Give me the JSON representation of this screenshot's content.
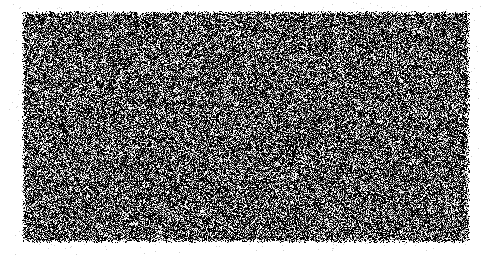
{
  "canvas": {
    "width": 492,
    "height": 256,
    "background_color": "#ffffff"
  },
  "image": {
    "type": "random-noise-field",
    "description": "Full-bleed rectangular field of high-frequency black-and-white random noise (salt-and-pepper static). No text, icons, axes, legends or interface chrome are present anywhere in the image.",
    "title": "Random noise field"
  },
  "noise_field": {
    "name": "noise-field",
    "left": 22,
    "top": 11,
    "width": 448,
    "height": 232,
    "cell_size": 1,
    "black_color": "#000000",
    "white_color": "#ffffff",
    "black_fraction": 0.5,
    "gray_fraction": 0.3,
    "gray_min": 40,
    "gray_max": 225,
    "seed": 20240517,
    "edge_fade_px": 3
  },
  "margin": {
    "name": "margin-speckle",
    "color": "#ffffff",
    "speckle_color": "#cfcfcf",
    "speckle_density": 0.012,
    "speckle_band_px": 14,
    "seed": 991733
  }
}
